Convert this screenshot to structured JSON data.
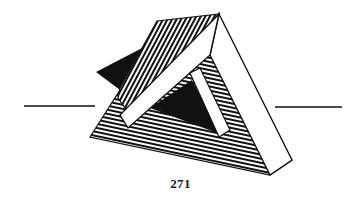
{
  "page": {
    "number": "271",
    "background": "#ffffff",
    "ink": "#111111"
  },
  "figure": {
    "rules": [
      {
        "side": "left",
        "x1": 24,
        "x2": 95,
        "y": 106
      },
      {
        "side": "right",
        "x1": 275,
        "x2": 342,
        "y": 107
      }
    ]
  }
}
